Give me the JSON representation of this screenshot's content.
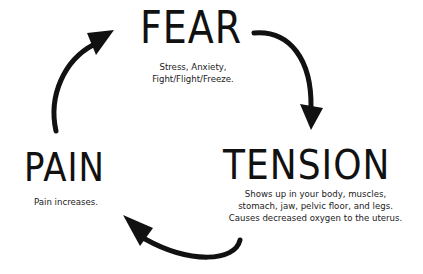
{
  "diagram": {
    "type": "cycle",
    "nodes": [
      {
        "id": "fear",
        "title": "FEAR",
        "description": [
          "Stress, Anxiety,",
          "Fight/Flight/Freeze."
        ]
      },
      {
        "id": "tension",
        "title": "TENSION",
        "description": [
          "Shows up in your body, muscles,",
          "stomach, jaw, pelvic floor, and legs.",
          "Causes decreased oxygen to the uterus."
        ]
      },
      {
        "id": "pain",
        "title": "PAIN",
        "description": [
          "Pain increases."
        ]
      }
    ],
    "edges": [
      {
        "from": "fear",
        "to": "tension",
        "icon": "curved-arrow-down"
      },
      {
        "from": "tension",
        "to": "pain",
        "icon": "curved-arrow-left"
      },
      {
        "from": "pain",
        "to": "fear",
        "icon": "curved-arrow-up"
      }
    ],
    "colors": {
      "ink": "#111111",
      "background": "#ffffff"
    }
  }
}
